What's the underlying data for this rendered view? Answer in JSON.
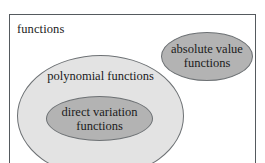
{
  "diagram": {
    "type": "euler-diagram",
    "universe": {
      "label": "functions",
      "shape": "rectangle",
      "fill_color": "#ffffff",
      "border_color": "#555a5e"
    },
    "sets": [
      {
        "id": "polynomial",
        "label": "polynomial functions",
        "shape": "ellipse",
        "fill_color": "#e3e3e3",
        "border_color": "#6d7174",
        "contained_in": "functions"
      },
      {
        "id": "direct-variation",
        "label": "direct variation\nfunctions",
        "shape": "ellipse",
        "fill_color": "#b3b3b3",
        "border_color": "#6d7174",
        "contained_in": "polynomial"
      },
      {
        "id": "absolute-value",
        "label": "absolute value\nfunctions",
        "shape": "ellipse",
        "fill_color": "#b3b3b3",
        "border_color": "#6d7174",
        "contained_in": "functions"
      }
    ]
  }
}
